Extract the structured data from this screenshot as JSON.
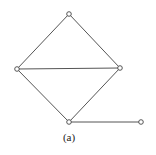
{
  "diagram": {
    "type": "graph",
    "caption": "(a)",
    "colors": {
      "edge": "#555555",
      "node_stroke": "#444444",
      "node_fill": "#ffffff",
      "caption": "#222222"
    },
    "nodes": [
      {
        "id": "top",
        "x": 69,
        "y": 14
      },
      {
        "id": "left",
        "x": 17,
        "y": 69
      },
      {
        "id": "right",
        "x": 120,
        "y": 68
      },
      {
        "id": "bottom",
        "x": 69,
        "y": 122
      },
      {
        "id": "tail",
        "x": 141,
        "y": 122
      }
    ],
    "edges": [
      {
        "from": "top",
        "to": "left"
      },
      {
        "from": "top",
        "to": "right"
      },
      {
        "from": "left",
        "to": "right"
      },
      {
        "from": "left",
        "to": "bottom"
      },
      {
        "from": "right",
        "to": "bottom"
      },
      {
        "from": "bottom",
        "to": "tail"
      }
    ]
  }
}
